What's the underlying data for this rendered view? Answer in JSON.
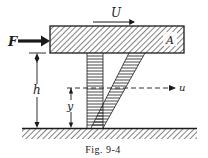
{
  "figure": {
    "caption": "Fig. 9-4",
    "labels": {
      "force": "F",
      "plate_velocity": "U",
      "plate_area": "A",
      "gap_height": "h",
      "height_coordinate": "y",
      "local_velocity": "u"
    }
  },
  "colors": {
    "ink": "#1a1a1a",
    "background": "#ffffff"
  }
}
